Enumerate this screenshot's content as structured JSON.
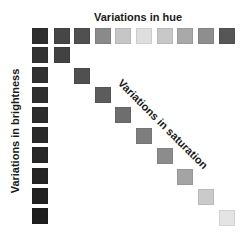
{
  "labels": {
    "hue": "Variations in hue",
    "brightness": "Variations in brightness",
    "saturation": "Variations in saturation"
  },
  "grid": {
    "square_size": 16,
    "hue_row": {
      "y": 28,
      "x": [
        32,
        54,
        74,
        95,
        115,
        136,
        157,
        177,
        198,
        219
      ],
      "colors": [
        "#2e2e2e",
        "#464646",
        "#505050",
        "#8a8a8a",
        "#c6c6c6",
        "#dedede",
        "#c8c8c8",
        "#a9a9a9",
        "#8e8e8e",
        "#565656"
      ]
    },
    "brightness_column": {
      "x": 32,
      "y": [
        47,
        67,
        87,
        107,
        127,
        147,
        168,
        188,
        208
      ],
      "colors": [
        "#333333",
        "#313131",
        "#2f2f2f",
        "#2c2c2c",
        "#2a2a2a",
        "#272727",
        "#252525",
        "#222222",
        "#1f1f1f"
      ]
    },
    "saturation_diagonal": {
      "x": [
        54,
        74,
        95,
        115,
        136,
        157,
        177,
        198,
        219
      ],
      "y": [
        47,
        68,
        87,
        107,
        128,
        148,
        169,
        189,
        210
      ],
      "colors": [
        "#424242",
        "#505050",
        "#5c5c5c",
        "#6e6e6e",
        "#7e7e7e",
        "#8c8c8c",
        "#a4a4a4",
        "#cacaca",
        "#e4e4e4"
      ]
    }
  }
}
